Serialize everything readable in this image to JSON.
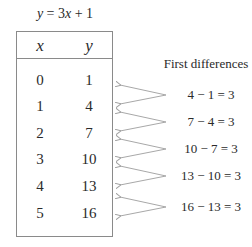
{
  "equation": "y = 3x + 1",
  "table": {
    "headers": [
      "x",
      "y"
    ],
    "rows": [
      {
        "x": "0",
        "y": "1"
      },
      {
        "x": "1",
        "y": "4"
      },
      {
        "x": "2",
        "y": "7"
      },
      {
        "x": "3",
        "y": "10"
      },
      {
        "x": "4",
        "y": "13"
      },
      {
        "x": "5",
        "y": "16"
      }
    ]
  },
  "first_differences": {
    "title": "First differences",
    "items": [
      "4 − 1 = 3",
      "7 − 4 = 3",
      "10 − 7 = 3",
      "13 − 10 = 3",
      "16 − 13 = 3"
    ]
  },
  "colors": {
    "border": "#8a8a8a",
    "arrow": "#a0a0a0",
    "text": "#2a2a2a"
  }
}
